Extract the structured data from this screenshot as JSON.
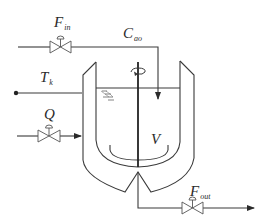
{
  "diagram": {
    "type": "CSTR process schematic",
    "colors": {
      "line": "#3a3a3a",
      "background": "#ffffff"
    },
    "labels": {
      "f_in": {
        "main": "F",
        "sub": "in"
      },
      "c_ao": {
        "main": "C",
        "sub": "ao"
      },
      "t_k": {
        "main": "T",
        "sub": "k"
      },
      "q": {
        "main": "Q",
        "sub": ""
      },
      "v": {
        "main": "V",
        "sub": ""
      },
      "f_out": {
        "main": "F",
        "sub": "out"
      }
    },
    "components": [
      "inlet-feed-line",
      "inlet-valve",
      "coolant-temperature-line",
      "heat-input-line",
      "heat-valve",
      "cooling-jacket",
      "reactor-vessel",
      "stirrer",
      "liquid-level",
      "outlet-line",
      "outlet-valve"
    ]
  }
}
